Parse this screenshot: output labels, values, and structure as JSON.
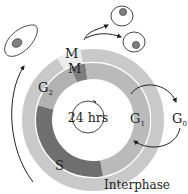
{
  "diagram": {
    "center_label": "24 hrs",
    "outer_ring": {
      "label": "Interphase",
      "mitosis_label": "M"
    },
    "phases": [
      {
        "id": "M",
        "label": "M",
        "sub": ""
      },
      {
        "id": "G1",
        "label": "G",
        "sub": "1"
      },
      {
        "id": "S",
        "label": "S",
        "sub": ""
      },
      {
        "id": "G2",
        "label": "G",
        "sub": "2"
      }
    ],
    "exit_phase": {
      "label": "G",
      "sub": "0"
    },
    "colors": {
      "outer_ring": "#c9c9c9",
      "outer_mitosis": "#ececec",
      "g1": "#bababa",
      "g2": "#b2b2b2",
      "s": "#6f6f6f",
      "m_inner": "#7e7e7e",
      "cell_nucleus": "#808080",
      "stroke": "#333333"
    }
  }
}
